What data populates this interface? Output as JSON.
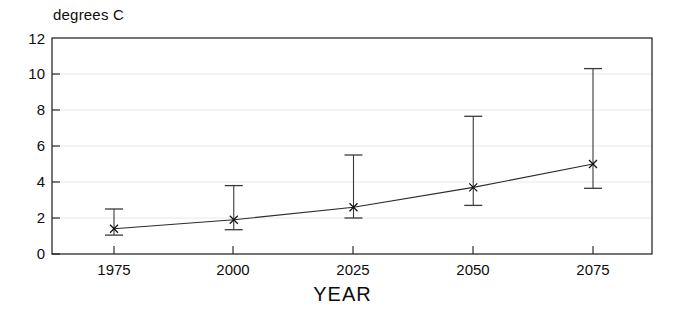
{
  "chart_data": {
    "type": "line",
    "title": "",
    "xlabel": "YEAR",
    "ylabel": "degrees C",
    "x": [
      1975,
      2000,
      2025,
      2050,
      2075
    ],
    "xtick_labels": [
      "1975",
      "2000",
      "2025",
      "2050",
      "2075"
    ],
    "ytick_labels": [
      "0",
      "2",
      "4",
      "6",
      "8",
      "10",
      "12"
    ],
    "ytick_values": [
      0,
      2,
      4,
      6,
      8,
      10,
      12
    ],
    "xlim": [
      1962,
      1975,
      2075,
      2105
    ],
    "ylim": [
      0,
      12
    ],
    "grid": true,
    "legend": "none",
    "series": [
      {
        "name": "projected warming",
        "values": [
          1.4,
          1.9,
          2.6,
          3.7,
          5.0
        ],
        "error_low": [
          1.05,
          1.35,
          2.0,
          2.7,
          3.65
        ],
        "error_high": [
          2.5,
          3.8,
          5.5,
          7.65,
          10.3
        ],
        "marker": "cross"
      }
    ]
  },
  "axes": {
    "y_axis_caption": "degrees C",
    "x_axis_caption": "YEAR"
  }
}
